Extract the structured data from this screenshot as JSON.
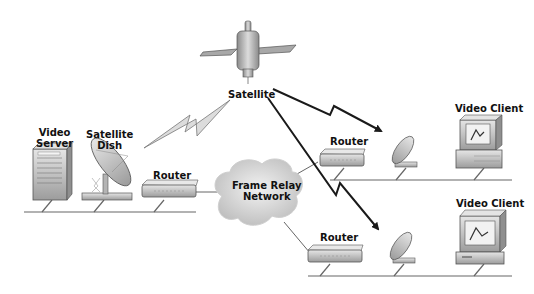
{
  "diagram": {
    "type": "network-topology",
    "title": "",
    "nodes": [
      {
        "id": "satellite",
        "label": "Satellite",
        "kind": "satellite"
      },
      {
        "id": "video-server",
        "label": "Video Server",
        "label_lines": [
          "Video",
          "Server"
        ],
        "kind": "server"
      },
      {
        "id": "sat-dish-main",
        "label": "Satellite Dish",
        "label_lines": [
          "Satellite",
          "Dish"
        ],
        "kind": "satellite-dish"
      },
      {
        "id": "router-main",
        "label": "Router",
        "kind": "router"
      },
      {
        "id": "frame-relay",
        "label": "Frame Relay Network",
        "label_lines": [
          "Frame Relay",
          "Network"
        ],
        "kind": "cloud"
      },
      {
        "id": "router-site1",
        "label": "Router",
        "kind": "router"
      },
      {
        "id": "dish-site1",
        "label": "",
        "kind": "satellite-dish"
      },
      {
        "id": "client-site1",
        "label": "Video Client",
        "kind": "workstation"
      },
      {
        "id": "router-site2",
        "label": "Router",
        "kind": "router"
      },
      {
        "id": "dish-site2",
        "label": "",
        "kind": "satellite-dish"
      },
      {
        "id": "client-site2",
        "label": "Video Client",
        "kind": "workstation"
      }
    ],
    "edges": [
      {
        "from": "sat-dish-main",
        "to": "satellite",
        "style": "lightning-uplink"
      },
      {
        "from": "satellite",
        "to": "dish-site1",
        "style": "lightning-arrow"
      },
      {
        "from": "satellite",
        "to": "dish-site2",
        "style": "lightning-arrow"
      },
      {
        "from": "router-main",
        "to": "frame-relay",
        "style": "line"
      },
      {
        "from": "frame-relay",
        "to": "router-site1",
        "style": "line"
      },
      {
        "from": "frame-relay",
        "to": "router-site2",
        "style": "line"
      }
    ],
    "segments": [
      {
        "id": "lan-main",
        "members": [
          "video-server",
          "sat-dish-main",
          "router-main"
        ]
      },
      {
        "id": "lan-site1",
        "members": [
          "router-site1",
          "dish-site1",
          "client-site1"
        ]
      },
      {
        "id": "lan-site2",
        "members": [
          "router-site2",
          "dish-site2",
          "client-site2"
        ]
      }
    ]
  },
  "labels": {
    "satellite": "Satellite",
    "video_server_1": "Video",
    "video_server_2": "Server",
    "sat_dish_1": "Satellite",
    "sat_dish_2": "Dish",
    "router_main": "Router",
    "frame_relay_1": "Frame Relay",
    "frame_relay_2": "Network",
    "router_site1": "Router",
    "client_site1": "Video Client",
    "router_site2": "Router",
    "client_site2": "Video Client"
  },
  "colors": {
    "background": "#ffffff",
    "line": "#555555",
    "arrow": "#1a1a1a",
    "device_body": "#c8c8c8",
    "device_shade": "#9a9a9a",
    "cloud": "#d4d4d4"
  }
}
